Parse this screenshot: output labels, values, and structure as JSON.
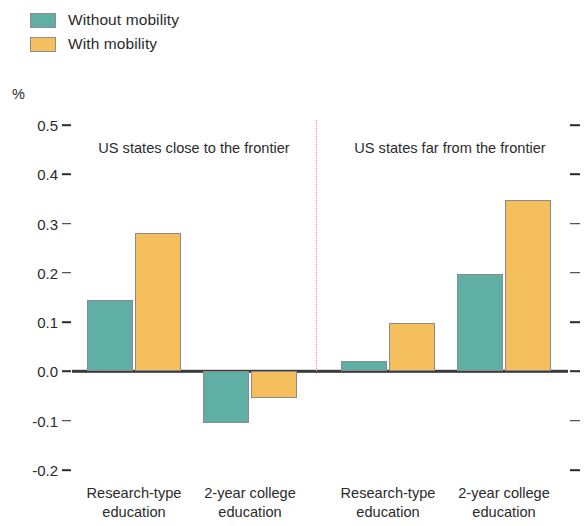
{
  "chart_data": {
    "type": "bar",
    "title": "",
    "subtitle": "",
    "xlabel": "",
    "ylabel": "%",
    "ylim": [
      -0.2,
      0.5
    ],
    "yticks": [
      0.5,
      0.4,
      0.3,
      0.2,
      0.1,
      0.0,
      -0.1,
      -0.2
    ],
    "ytick_labels": [
      "0.5",
      "0.4",
      "0.3",
      "0.2",
      "0.1",
      "0.0",
      "-0.1",
      "-0.2"
    ],
    "grid": false,
    "legend_position": "top-left",
    "panels": [
      {
        "title": "US states close to the frontier",
        "categories": [
          "Research-type education",
          "2-year college education"
        ]
      },
      {
        "title": "US states far from the frontier",
        "categories": [
          "Research-type education",
          "2-year college education"
        ]
      }
    ],
    "categories": [
      "Research-type education",
      "2-year college education",
      "Research-type education",
      "2-year college education"
    ],
    "series": [
      {
        "name": "Without mobility",
        "color": "#5FAFA4",
        "values": [
          0.145,
          -0.105,
          0.022,
          0.197
        ]
      },
      {
        "name": "With mobility",
        "color": "#F6BF5E",
        "values": [
          0.28,
          -0.053,
          0.098,
          0.348
        ]
      }
    ],
    "annotations": {
      "divider": "dotted vertical separator between panels",
      "divider_color": "#e8817d",
      "zero_line_color": "#3a3a3a"
    }
  },
  "legend": {
    "items": [
      {
        "label": "Without mobility",
        "color": "#5FAFA4"
      },
      {
        "label": "With mobility",
        "color": "#F6BF5E"
      }
    ]
  },
  "axis": {
    "unit": "%"
  }
}
